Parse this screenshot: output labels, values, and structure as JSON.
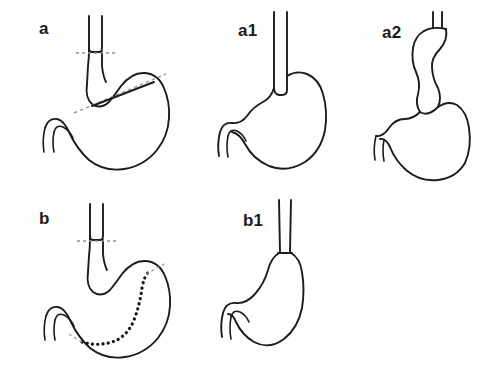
{
  "figure": {
    "background_color": "#fefefe",
    "outline_color": "#1b1b1b",
    "guide_line_color": "#9a9a9a",
    "resection_line_color": "#111111",
    "width": 485,
    "height": 370
  },
  "panels": [
    {
      "id": "a",
      "label": "a",
      "caption": "Proximal stomach with dashed esophageal transection line and oblique dashed gastric resection line",
      "organs": [
        "esophagus",
        "stomach",
        "duodenum"
      ],
      "markings": [
        "esophageal-transection-dashed-line",
        "oblique-gastric-resection-dashed-line"
      ]
    },
    {
      "id": "a1",
      "label": "a1",
      "caption": "Gastric remnant after proximal resection with esophagus anastomosed to the remaining stomach",
      "organs": [
        "esophagus",
        "stomach",
        "duodenum"
      ],
      "markings": []
    },
    {
      "id": "a2",
      "label": "a2",
      "caption": "Reconstruction with an interposed S-shaped intestinal segment between esophagus and gastric remnant",
      "organs": [
        "esophagus",
        "interposition-graft",
        "stomach",
        "duodenum"
      ],
      "markings": []
    },
    {
      "id": "b",
      "label": "b",
      "caption": "Stomach with dashed esophageal transection line and curved heavy dotted sleeve resection line",
      "organs": [
        "esophagus",
        "stomach",
        "duodenum"
      ],
      "markings": [
        "esophageal-transection-dashed-line",
        "curved-sleeve-resection-dotted-line"
      ]
    },
    {
      "id": "b1",
      "label": "b1",
      "caption": "Narrow gastric tube (sleeve) anastomosed to the esophagus after sleeve resection",
      "organs": [
        "esophagus",
        "gastric-tube",
        "duodenum"
      ],
      "markings": []
    }
  ]
}
